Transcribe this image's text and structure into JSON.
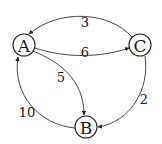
{
  "graph": {
    "type": "directed-weighted",
    "nodes": [
      {
        "id": "A",
        "label": "A",
        "x": 24,
        "y": 45
      },
      {
        "id": "C",
        "label": "C",
        "x": 140,
        "y": 45
      },
      {
        "id": "B",
        "label": "B",
        "x": 86,
        "y": 127
      }
    ],
    "edges": [
      {
        "from": "C",
        "to": "A",
        "weight": "3"
      },
      {
        "from": "A",
        "to": "C",
        "weight": "6"
      },
      {
        "from": "A",
        "to": "B",
        "weight": "5"
      },
      {
        "from": "C",
        "to": "B",
        "weight": "2"
      },
      {
        "from": "B",
        "to": "A",
        "weight": "10"
      }
    ]
  }
}
